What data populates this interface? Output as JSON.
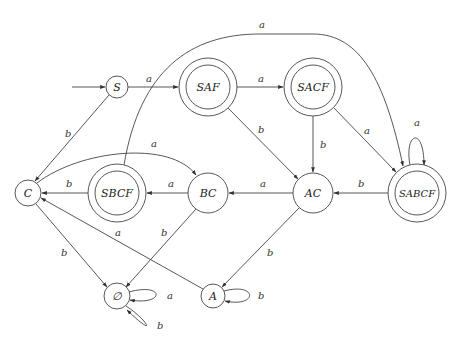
{
  "diagram": {
    "type": "DFA state diagram",
    "start_state": "S",
    "states": [
      {
        "id": "S",
        "label": "S",
        "x": 117,
        "y": 87,
        "r": 11,
        "accepting": false
      },
      {
        "id": "SAF",
        "label": "SAF",
        "x": 208,
        "y": 87,
        "r": 29,
        "accepting": true
      },
      {
        "id": "SACF",
        "label": "SACF",
        "x": 313,
        "y": 87,
        "r": 29,
        "accepting": true
      },
      {
        "id": "C",
        "label": "C",
        "x": 28,
        "y": 193,
        "r": 13,
        "accepting": false
      },
      {
        "id": "SBCF",
        "label": "SBCF",
        "x": 117,
        "y": 193,
        "r": 29,
        "accepting": true
      },
      {
        "id": "BC",
        "label": "BC",
        "x": 208,
        "y": 193,
        "r": 20,
        "accepting": false
      },
      {
        "id": "AC",
        "label": "AC",
        "x": 313,
        "y": 193,
        "r": 20,
        "accepting": false
      },
      {
        "id": "SABCF",
        "label": "SABCF",
        "x": 417,
        "y": 193,
        "r": 29,
        "accepting": true
      },
      {
        "id": "EMPTY",
        "label": "∅",
        "x": 117,
        "y": 296,
        "r": 13,
        "accepting": false
      },
      {
        "id": "A",
        "label": "A",
        "x": 213,
        "y": 296,
        "r": 12,
        "accepting": false
      }
    ],
    "transitions": [
      {
        "from": "S",
        "to": "SAF",
        "symbol": "a"
      },
      {
        "from": "S",
        "to": "C",
        "symbol": "b"
      },
      {
        "from": "SAF",
        "to": "SACF",
        "symbol": "a"
      },
      {
        "from": "SAF",
        "to": "AC",
        "symbol": "b"
      },
      {
        "from": "SACF",
        "to": "AC",
        "symbol": "b"
      },
      {
        "from": "SACF",
        "to": "SABCF",
        "symbol": "a"
      },
      {
        "from": "SBCF",
        "to": "SABCF",
        "symbol": "a"
      },
      {
        "from": "SBCF",
        "to": "C",
        "symbol": "b"
      },
      {
        "from": "C",
        "to": "BC",
        "symbol": "a"
      },
      {
        "from": "C",
        "to": "EMPTY",
        "symbol": "b"
      },
      {
        "from": "BC",
        "to": "SBCF",
        "symbol": "a"
      },
      {
        "from": "BC",
        "to": "EMPTY",
        "symbol": "b"
      },
      {
        "from": "AC",
        "to": "BC",
        "symbol": "a"
      },
      {
        "from": "AC",
        "to": "A",
        "symbol": "b"
      },
      {
        "from": "SABCF",
        "to": "AC",
        "symbol": "b"
      },
      {
        "from": "SABCF",
        "to": "SABCF",
        "symbol": "a"
      },
      {
        "from": "A",
        "to": "C",
        "symbol": "a"
      },
      {
        "from": "A",
        "to": "A",
        "symbol": "b"
      },
      {
        "from": "EMPTY",
        "to": "EMPTY",
        "symbol": "a"
      },
      {
        "from": "EMPTY",
        "to": "EMPTY",
        "symbol": "b"
      }
    ],
    "edge_labels": {
      "s_saf": "a",
      "s_c": "b",
      "saf_sacf": "a",
      "saf_ac": "b",
      "sacf_ac": "b",
      "sacf_sabcf": "a",
      "sbcf_sabcf": "a",
      "sbcf_c": "b",
      "c_bc": "a",
      "c_empty": "b",
      "bc_sbcf": "a",
      "bc_empty": "b",
      "ac_bc": "a",
      "ac_a": "b",
      "sabcf_ac": "b",
      "sabcf_loop": "a",
      "a_c": "a",
      "a_loop": "b",
      "empty_loop_a": "a",
      "empty_loop_b": "b"
    },
    "colors": {
      "stroke": "#444444",
      "background": "#ffffff",
      "text": "#222222"
    }
  }
}
